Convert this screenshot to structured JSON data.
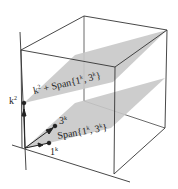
{
  "figure": {
    "type": "3d-subspace-diagram",
    "labels": {
      "upper_plane": "k² + Span{1ᵏ, 3ᵏ}",
      "lower_plane": "Span{1ᵏ, 3ᵏ}",
      "vertical_vector": "k²",
      "vector_a": "3ᵏ",
      "vector_b": "1ᵏ"
    },
    "upper_plane_parts": {
      "base": "k",
      "exp": "2",
      "plus": " + Span{1",
      "exp2": "k",
      "mid": ", 3",
      "exp3": "k",
      "close": "}"
    },
    "lower_plane_parts": {
      "pre": "Span{1",
      "exp1": "k",
      "mid": ", 3",
      "exp2": "k",
      "close": "}"
    },
    "vertical_parts": {
      "base": "k",
      "exp": "2"
    },
    "vector_a_parts": {
      "base": "3",
      "exp": "k"
    },
    "vector_b_parts": {
      "base": "1",
      "exp": "k"
    },
    "colors": {
      "plane": "#c8c8c8",
      "line": "#333333",
      "text": "#222222"
    }
  }
}
